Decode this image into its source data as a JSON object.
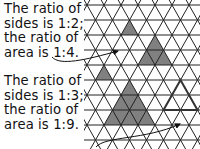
{
  "captions": {
    "top": [
      "The ratio of",
      "sides is 1:2;",
      "the ratio of",
      "area is 1:4."
    ],
    "bottom": [
      "The ratio of",
      "sides is 1:3;",
      "the ratio of",
      "area is 1:9."
    ]
  },
  "grid": {
    "type": "isometric-triangle-grid",
    "edge_px": 17,
    "row_height_px": 15,
    "line_color": "#222222",
    "fill_color": "#808080"
  },
  "shapes": [
    {
      "name": "small-triangle-unit",
      "scale": 1,
      "fill": "#808080"
    },
    {
      "name": "large-triangle-double",
      "scale": 2,
      "fill": "#808080"
    },
    {
      "name": "small-triangle-unit-lower",
      "scale": 1,
      "fill": "#808080"
    },
    {
      "name": "large-triangle-triple",
      "scale": 3,
      "fill": "#808080"
    },
    {
      "name": "outlined-triangle",
      "scale": 2,
      "fill": "none"
    }
  ]
}
